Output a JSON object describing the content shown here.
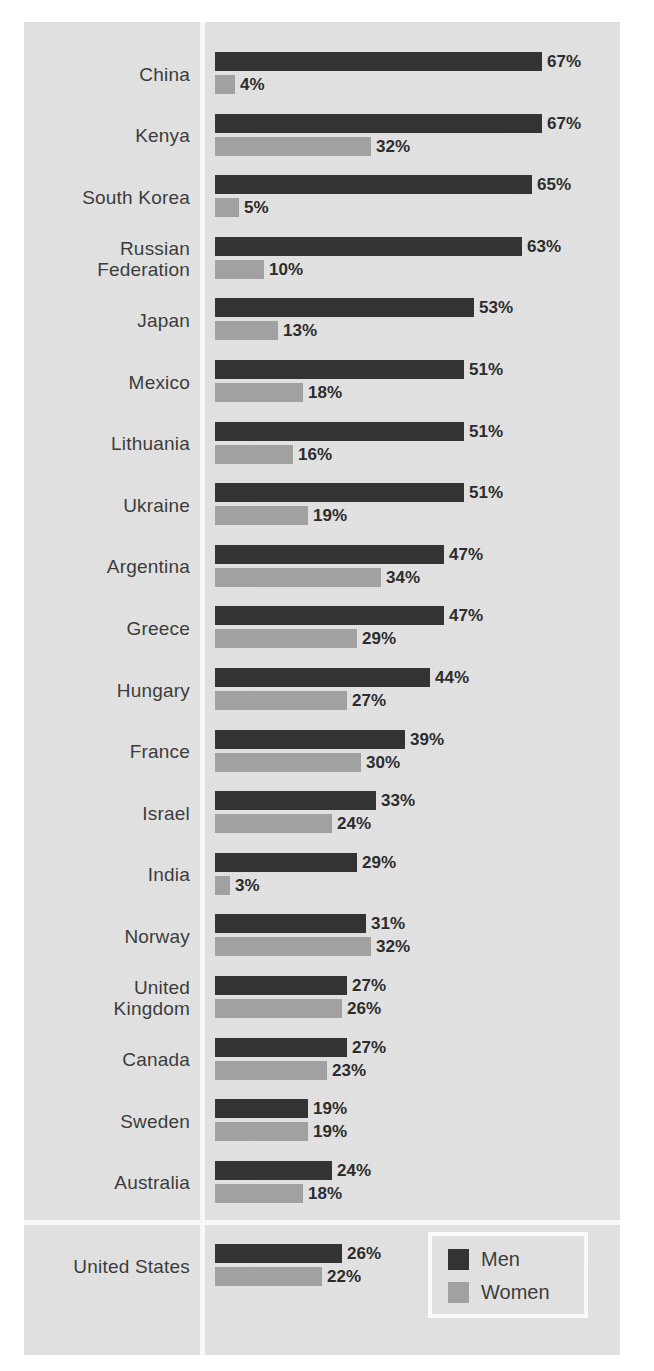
{
  "chart_data": {
    "type": "bar",
    "orientation": "horizontal",
    "title": "",
    "subtitle": "",
    "xlabel": "",
    "ylabel": "",
    "xlim": [
      0,
      70
    ],
    "grid": false,
    "legend_position": "bottom-right",
    "value_suffix": "%",
    "categories": [
      "China",
      "Kenya",
      "South Korea",
      "Russian\nFederation",
      "Japan",
      "Mexico",
      "Lithuania",
      "Ukraine",
      "Argentina",
      "Greece",
      "Hungary",
      "France",
      "Israel",
      "India",
      "Norway",
      "United\nKingdom",
      "Canada",
      "Sweden",
      "Australia",
      "United States"
    ],
    "series": [
      {
        "name": "Men",
        "color": "#323232",
        "values": [
          67,
          67,
          65,
          63,
          53,
          51,
          51,
          51,
          47,
          47,
          44,
          39,
          33,
          29,
          31,
          27,
          27,
          19,
          24,
          26
        ],
        "labels": [
          "67%",
          "67%",
          "65%",
          "63%",
          "53%",
          "51%",
          "51%",
          "51%",
          "47%",
          "47%",
          "44%",
          "39%",
          "33%",
          "29%",
          "31%",
          "27%",
          "27%",
          "19%",
          "24%",
          "26%"
        ]
      },
      {
        "name": "Women",
        "color": "#a2a2a2",
        "values": [
          4,
          32,
          5,
          10,
          13,
          18,
          16,
          19,
          34,
          29,
          27,
          30,
          24,
          3,
          32,
          26,
          23,
          19,
          18,
          22
        ],
        "labels": [
          "4%",
          "32%",
          "5%",
          "10%",
          "13%",
          "18%",
          "16%",
          "19%",
          "34%",
          "29%",
          "27%",
          "30%",
          "24%",
          "3%",
          "32%",
          "26%",
          "23%",
          "19%",
          "18%",
          "22%"
        ]
      }
    ]
  },
  "legend": {
    "items": [
      {
        "label": "Men",
        "color": "#323232"
      },
      {
        "label": "Women",
        "color": "#a2a2a2"
      }
    ]
  },
  "colors": {
    "panel_background": "#e3e3e3",
    "page_background": "#ffffff",
    "divider": "#fbfbfb",
    "men": "#323232",
    "women": "#a2a2a2",
    "text": "#3b3b3b",
    "value_text": "#2a2a2a"
  }
}
